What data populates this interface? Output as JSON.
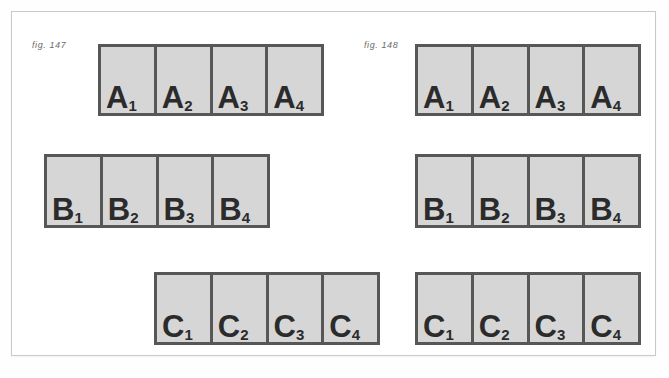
{
  "figures": [
    {
      "id": "fig-147",
      "caption": "fig. 147",
      "rows": [
        {
          "key": "A",
          "cells": [
            {
              "letter": "A",
              "subscript": "1"
            },
            {
              "letter": "A",
              "subscript": "2"
            },
            {
              "letter": "A",
              "subscript": "3"
            },
            {
              "letter": "A",
              "subscript": "4"
            }
          ]
        },
        {
          "key": "B",
          "cells": [
            {
              "letter": "B",
              "subscript": "1"
            },
            {
              "letter": "B",
              "subscript": "2"
            },
            {
              "letter": "B",
              "subscript": "3"
            },
            {
              "letter": "B",
              "subscript": "4"
            }
          ]
        },
        {
          "key": "C",
          "cells": [
            {
              "letter": "C",
              "subscript": "1"
            },
            {
              "letter": "C",
              "subscript": "2"
            },
            {
              "letter": "C",
              "subscript": "3"
            },
            {
              "letter": "C",
              "subscript": "4"
            }
          ]
        }
      ]
    },
    {
      "id": "fig-148",
      "caption": "fig. 148",
      "rows": [
        {
          "key": "A",
          "cells": [
            {
              "letter": "A",
              "subscript": "1"
            },
            {
              "letter": "A",
              "subscript": "2"
            },
            {
              "letter": "A",
              "subscript": "3"
            },
            {
              "letter": "A",
              "subscript": "4"
            }
          ]
        },
        {
          "key": "B",
          "cells": [
            {
              "letter": "B",
              "subscript": "1"
            },
            {
              "letter": "B",
              "subscript": "2"
            },
            {
              "letter": "B",
              "subscript": "3"
            },
            {
              "letter": "B",
              "subscript": "4"
            }
          ]
        },
        {
          "key": "C",
          "cells": [
            {
              "letter": "C",
              "subscript": "1"
            },
            {
              "letter": "C",
              "subscript": "2"
            },
            {
              "letter": "C",
              "subscript": "3"
            },
            {
              "letter": "C",
              "subscript": "4"
            }
          ]
        }
      ]
    }
  ],
  "colors": {
    "cell_fill": "#d6d6d6",
    "cell_border": "#575757",
    "label_text": "#2b2b2b",
    "caption_text": "#6b6b6b",
    "plate_border": "#c9c9c9",
    "background": "#ffffff"
  }
}
